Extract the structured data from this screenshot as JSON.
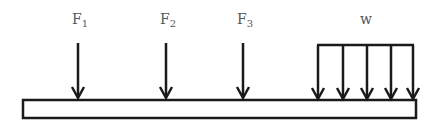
{
  "diagram": {
    "type": "beam-load-diagram",
    "beam": {
      "x": 23,
      "y": 100,
      "width": 393,
      "height": 18
    },
    "point_loads": [
      {
        "label": "F",
        "subscript": "1",
        "x": 78,
        "label_x": 72
      },
      {
        "label": "F",
        "subscript": "2",
        "x": 166,
        "label_x": 160
      },
      {
        "label": "F",
        "subscript": "3",
        "x": 243,
        "label_x": 237
      }
    ],
    "distributed_load": {
      "label": "w",
      "label_x": 363,
      "x_start": 318,
      "x_end": 413,
      "arrow_x": [
        318,
        343,
        367,
        391,
        413
      ]
    },
    "colors": {
      "stroke": "#1a1a1a",
      "label": "#555555"
    }
  }
}
